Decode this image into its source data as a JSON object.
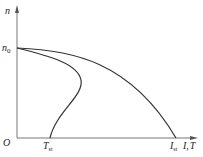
{
  "diagram": {
    "y_axis_label": "n",
    "x_axis_label": "I, T",
    "x_axis_label_I": "I",
    "x_axis_label_sep": ",",
    "x_axis_label_T": "T",
    "origin_label": "O",
    "n0_label_main": "n",
    "n0_label_sub": "0",
    "tst_label_main": "T",
    "tst_label_sub": "st",
    "ist_label_main": "I",
    "ist_label_sub": "st",
    "curves": [
      {
        "name": "current-characteristic",
        "description": "n vs I, from n0 down to I_st"
      },
      {
        "name": "torque-characteristic",
        "description": "n vs T, S-shaped, from n0 down to T_st"
      }
    ],
    "colors": {
      "axis": "#777777",
      "curve": "#333333",
      "text": "#222222"
    }
  }
}
